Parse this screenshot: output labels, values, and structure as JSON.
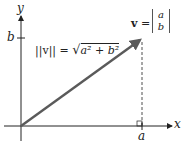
{
  "diagram": {
    "axis_x_label": "x",
    "axis_y_label": "y",
    "tick_a": "a",
    "tick_b": "b",
    "norm_formula": {
      "lhs": "||v|| = ",
      "radicand": "a² + b²"
    },
    "vector_label": {
      "name": "v",
      "equals": "=",
      "top": "a",
      "bottom": "b"
    },
    "colors": {
      "vector": "#5a5a5a",
      "axes": "#222222"
    }
  }
}
